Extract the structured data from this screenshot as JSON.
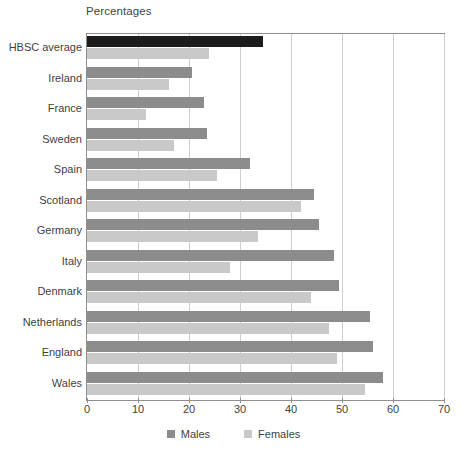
{
  "chart_data": {
    "type": "bar",
    "orientation": "horizontal",
    "title": "Percentages",
    "xlabel": "",
    "ylabel": "",
    "xlim": [
      0,
      70
    ],
    "xticks": [
      0,
      10,
      20,
      30,
      40,
      50,
      60,
      70
    ],
    "grid": true,
    "legend_position": "bottom",
    "categories": [
      "HBSC average",
      "Ireland",
      "France",
      "Sweden",
      "Spain",
      "Scotland",
      "Germany",
      "Italy",
      "Denmark",
      "Netherlands",
      "England",
      "Wales"
    ],
    "series": [
      {
        "name": "Males",
        "color": "#8c8c8c",
        "highlight_color": "#1d1d1d",
        "values": [
          34.5,
          20.5,
          23,
          23.5,
          32,
          44.5,
          45.5,
          48.5,
          49.5,
          55.5,
          56,
          58
        ]
      },
      {
        "name": "Females",
        "color": "#c9c9c9",
        "values": [
          24,
          16,
          11.5,
          17,
          25.5,
          42,
          33.5,
          28,
          44,
          47.5,
          49,
          54.5
        ]
      }
    ],
    "highlighted_category": "HBSC average"
  },
  "legend": {
    "items": [
      {
        "label": "Males",
        "swatch": "males"
      },
      {
        "label": "Females",
        "swatch": "females"
      }
    ]
  }
}
